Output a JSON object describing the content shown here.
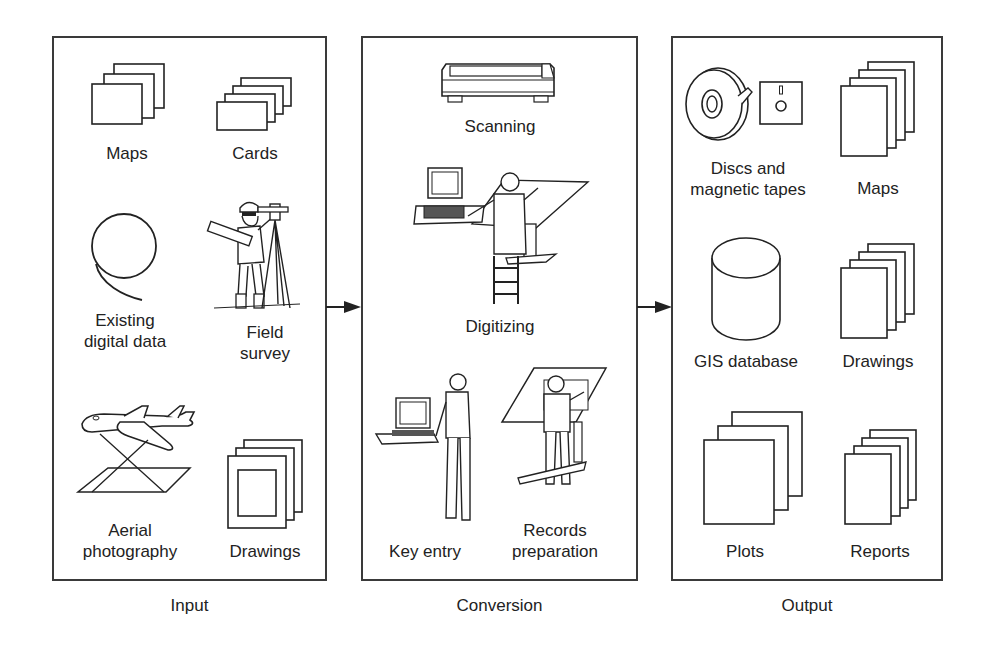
{
  "diagram": {
    "type": "process-flow",
    "stages": [
      {
        "id": "input",
        "title": "Input",
        "items": [
          {
            "label": "Maps",
            "icon": "stacked-sheets-icon"
          },
          {
            "label": "Cards",
            "icon": "stacked-cards-icon"
          },
          {
            "label": "Existing\ndigital data",
            "label_lines": [
              "Existing",
              "digital data"
            ],
            "icon": "tape-coil-icon"
          },
          {
            "label": "Field\nsurvey",
            "label_lines": [
              "Field",
              "survey"
            ],
            "icon": "surveyor-icon"
          },
          {
            "label": "Aerial\nphotography",
            "label_lines": [
              "Aerial",
              "photography"
            ],
            "icon": "airplane-icon"
          },
          {
            "label": "Drawings",
            "icon": "framed-drawings-icon"
          }
        ]
      },
      {
        "id": "conversion",
        "title": "Conversion",
        "items": [
          {
            "label": "Scanning",
            "icon": "scanner-icon"
          },
          {
            "label": "Digitizing",
            "icon": "digitizing-workstation-icon"
          },
          {
            "label": "Key entry",
            "icon": "key-entry-operator-icon"
          },
          {
            "label": "Records\npreparation",
            "label_lines": [
              "Records",
              "preparation"
            ],
            "icon": "drafting-table-icon"
          }
        ]
      },
      {
        "id": "output",
        "title": "Output",
        "items": [
          {
            "label": "Discs and\nmagnetic tapes",
            "label_lines": [
              "Discs and",
              "magnetic tapes"
            ],
            "icon": "tape-reel-and-disk-icon"
          },
          {
            "label": "Maps",
            "icon": "stacked-sheets-icon"
          },
          {
            "label": "GIS database",
            "icon": "database-cylinder-icon"
          },
          {
            "label": "Drawings",
            "icon": "stacked-sheets-icon"
          },
          {
            "label": "Plots",
            "icon": "stacked-sheets-icon"
          },
          {
            "label": "Reports",
            "icon": "stacked-sheets-icon"
          }
        ]
      }
    ],
    "connections": [
      {
        "from": "input",
        "to": "conversion"
      },
      {
        "from": "conversion",
        "to": "output"
      }
    ],
    "colors": {
      "line": "#2a2a2a",
      "text": "#222222",
      "background": "#ffffff"
    }
  }
}
